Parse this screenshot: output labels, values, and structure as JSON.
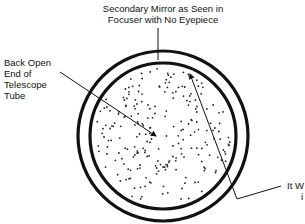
{
  "diagram": {
    "type": "telescope-view-illustration",
    "labels": {
      "top": [
        "Secondary Mirror as Seen in",
        "Focuser with No Eyepiece"
      ],
      "left": [
        "Back Open",
        "End of",
        "Telescope",
        "Tube"
      ],
      "right": [
        "It W",
        "i"
      ]
    },
    "circles": {
      "outer": {
        "cx": 163,
        "cy": 136,
        "r": 85
      },
      "inner": {
        "cx": 163,
        "cy": 136,
        "r": 73
      }
    },
    "colors": {
      "stroke": "#111111",
      "background": "#ffffff"
    }
  }
}
